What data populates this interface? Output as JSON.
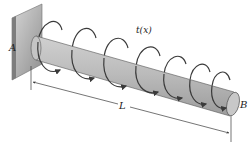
{
  "figure": {
    "type": "cantilever-shaft-distributed-torque",
    "labels": {
      "fixed_end": "A",
      "free_end": "B",
      "distributed_torque": "t(x)",
      "length": "L"
    },
    "torque_loop_count": 7
  },
  "colors": {
    "background": "#ffffff",
    "wall_light": "#c9c9c9",
    "wall_dark": "#8f8f8f",
    "rod_fill": "#b8b8b8",
    "rod_highlight": "#d2d2d2",
    "rod_shadow": "#9a9a9a",
    "line": "#3a3a3a",
    "text": "#222222"
  }
}
